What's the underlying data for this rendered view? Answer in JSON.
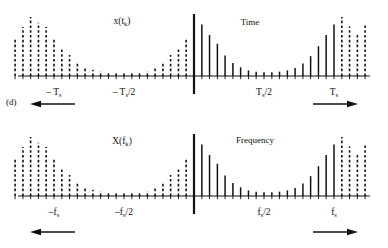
{
  "figure": {
    "panel_label": "(d)"
  },
  "panels": [
    {
      "id": "time",
      "signal_label": "x(t",
      "signal_label_sub": "k",
      "signal_label_close": ")",
      "domain_label": "Time",
      "ticks": [
        {
          "label": "– T",
          "sub": "s",
          "suffix": "",
          "x": -1.0
        },
        {
          "label": "– T",
          "sub": "s",
          "suffix": "/2",
          "x": -0.5
        },
        {
          "label": "T",
          "sub": "s",
          "suffix": "/2",
          "x": 0.5
        },
        {
          "label": "T",
          "sub": "s",
          "suffix": "",
          "x": 1.0
        }
      ],
      "left_arrow": "periodic-extension-left",
      "right_arrow": "periodic-extension-right"
    },
    {
      "id": "frequency",
      "signal_label": "X(f",
      "signal_label_sub": "k",
      "signal_label_close": ")",
      "domain_label": "Frequency",
      "ticks": [
        {
          "label": "–f",
          "sub": "s",
          "suffix": "",
          "x": -1.0
        },
        {
          "label": "–f",
          "sub": "s",
          "suffix": "/2",
          "x": -0.5
        },
        {
          "label": "f",
          "sub": "s",
          "suffix": "/2",
          "x": 0.5
        },
        {
          "label": "f",
          "sub": "s",
          "suffix": "",
          "x": 1.0
        }
      ],
      "left_arrow": "periodic-extension-left",
      "right_arrow": "periodic-extension-right"
    }
  ],
  "chart_data": {
    "type": "bar",
    "title": "",
    "subtitle": "",
    "xlabel": "",
    "ylabel": "",
    "grid": false,
    "legend": null,
    "note": "Two stem (impulse-train) plots. Stems are sampled values of a decaying exponential-like envelope peaking at the origin and repeating with period Ts (time panel) / fs (frequency panel). Solid stems mark the principal period; dashed stems mark the periodic repetitions.",
    "panels": [
      {
        "id": "time",
        "xlabel": "Time",
        "ylabel": "x(t_k)",
        "xlim": [
          -1.32,
          1.32
        ],
        "ylim": [
          0,
          1.0
        ],
        "xticks": [
          -1.0,
          -0.5,
          0.5,
          1.0
        ],
        "xticklabels": [
          "-T_s",
          "-T_s/2",
          "T_s/2",
          "T_s"
        ],
        "sample_spacing": 0.0555,
        "stems": [
          {
            "x": -1.278,
            "y": 0.62,
            "style": "dashed"
          },
          {
            "x": -1.222,
            "y": 0.79,
            "style": "dashed"
          },
          {
            "x": -1.167,
            "y": 0.95,
            "style": "dashed"
          },
          {
            "x": -1.111,
            "y": 0.86,
            "style": "dashed"
          },
          {
            "x": -1.056,
            "y": 0.79,
            "style": "dashed"
          },
          {
            "x": -1.0,
            "y": 0.62,
            "style": "dashed"
          },
          {
            "x": -0.944,
            "y": 0.46,
            "style": "dashed"
          },
          {
            "x": -0.889,
            "y": 0.34,
            "style": "dashed"
          },
          {
            "x": -0.833,
            "y": 0.23,
            "style": "dashed"
          },
          {
            "x": -0.778,
            "y": 0.14,
            "style": "dashed"
          },
          {
            "x": -0.722,
            "y": 0.1,
            "style": "dashed"
          },
          {
            "x": -0.667,
            "y": 0.08,
            "style": "dashed"
          },
          {
            "x": -0.611,
            "y": 0.07,
            "style": "dashed"
          },
          {
            "x": -0.556,
            "y": 0.06,
            "style": "dashed"
          },
          {
            "x": -0.5,
            "y": 0.06,
            "style": "dashed"
          },
          {
            "x": -0.444,
            "y": 0.06,
            "style": "dashed"
          },
          {
            "x": -0.389,
            "y": 0.07,
            "style": "dashed"
          },
          {
            "x": -0.333,
            "y": 0.08,
            "style": "dashed"
          },
          {
            "x": -0.278,
            "y": 0.14,
            "style": "dashed"
          },
          {
            "x": -0.222,
            "y": 0.23,
            "style": "dashed"
          },
          {
            "x": -0.167,
            "y": 0.34,
            "style": "dashed"
          },
          {
            "x": -0.111,
            "y": 0.46,
            "style": "dashed"
          },
          {
            "x": -0.056,
            "y": 0.62,
            "style": "dashed"
          },
          {
            "x": 0.0,
            "y": 1.0,
            "style": "center"
          },
          {
            "x": 0.056,
            "y": 0.83,
            "style": "solid"
          },
          {
            "x": 0.111,
            "y": 0.66,
            "style": "solid"
          },
          {
            "x": 0.167,
            "y": 0.52,
            "style": "solid"
          },
          {
            "x": 0.222,
            "y": 0.33,
            "style": "solid"
          },
          {
            "x": 0.278,
            "y": 0.21,
            "style": "solid"
          },
          {
            "x": 0.333,
            "y": 0.14,
            "style": "solid"
          },
          {
            "x": 0.389,
            "y": 0.09,
            "style": "solid"
          },
          {
            "x": 0.444,
            "y": 0.07,
            "style": "solid"
          },
          {
            "x": 0.5,
            "y": 0.06,
            "style": "solid"
          },
          {
            "x": 0.556,
            "y": 0.06,
            "style": "solid"
          },
          {
            "x": 0.611,
            "y": 0.07,
            "style": "solid"
          },
          {
            "x": 0.667,
            "y": 0.09,
            "style": "solid"
          },
          {
            "x": 0.722,
            "y": 0.13,
            "style": "solid"
          },
          {
            "x": 0.778,
            "y": 0.2,
            "style": "solid"
          },
          {
            "x": 0.833,
            "y": 0.32,
            "style": "solid"
          },
          {
            "x": 0.889,
            "y": 0.48,
            "style": "solid"
          },
          {
            "x": 0.944,
            "y": 0.66,
            "style": "solid"
          },
          {
            "x": 1.0,
            "y": 0.83,
            "style": "solid"
          },
          {
            "x": 1.056,
            "y": 0.95,
            "style": "dashed"
          },
          {
            "x": 1.111,
            "y": 0.8,
            "style": "dashed"
          },
          {
            "x": 1.167,
            "y": 0.66,
            "style": "dashed"
          },
          {
            "x": 1.222,
            "y": 0.82,
            "style": "dashed"
          }
        ]
      },
      {
        "id": "frequency",
        "xlabel": "Frequency",
        "ylabel": "X(f_k)",
        "xlim": [
          -1.32,
          1.32
        ],
        "ylim": [
          0,
          1.0
        ],
        "xticks": [
          -1.0,
          -0.5,
          0.5,
          1.0
        ],
        "xticklabels": [
          "-f_s",
          "-f_s/2",
          "f_s/2",
          "f_s"
        ],
        "sample_spacing": 0.0555,
        "stems": [
          {
            "x": -1.278,
            "y": 0.62,
            "style": "dashed"
          },
          {
            "x": -1.222,
            "y": 0.79,
            "style": "dashed"
          },
          {
            "x": -1.167,
            "y": 0.95,
            "style": "dashed"
          },
          {
            "x": -1.111,
            "y": 0.86,
            "style": "dashed"
          },
          {
            "x": -1.056,
            "y": 0.79,
            "style": "dashed"
          },
          {
            "x": -1.0,
            "y": 0.62,
            "style": "dashed"
          },
          {
            "x": -0.944,
            "y": 0.46,
            "style": "dashed"
          },
          {
            "x": -0.889,
            "y": 0.34,
            "style": "dashed"
          },
          {
            "x": -0.833,
            "y": 0.23,
            "style": "dashed"
          },
          {
            "x": -0.778,
            "y": 0.14,
            "style": "dashed"
          },
          {
            "x": -0.722,
            "y": 0.1,
            "style": "dashed"
          },
          {
            "x": -0.667,
            "y": 0.08,
            "style": "dashed"
          },
          {
            "x": -0.611,
            "y": 0.07,
            "style": "dashed"
          },
          {
            "x": -0.556,
            "y": 0.06,
            "style": "dashed"
          },
          {
            "x": -0.5,
            "y": 0.06,
            "style": "dashed"
          },
          {
            "x": -0.444,
            "y": 0.06,
            "style": "dashed"
          },
          {
            "x": -0.389,
            "y": 0.07,
            "style": "dashed"
          },
          {
            "x": -0.333,
            "y": 0.08,
            "style": "dashed"
          },
          {
            "x": -0.278,
            "y": 0.14,
            "style": "dashed"
          },
          {
            "x": -0.222,
            "y": 0.23,
            "style": "dashed"
          },
          {
            "x": -0.167,
            "y": 0.34,
            "style": "dashed"
          },
          {
            "x": -0.111,
            "y": 0.46,
            "style": "dashed"
          },
          {
            "x": -0.056,
            "y": 0.62,
            "style": "dashed"
          },
          {
            "x": 0.0,
            "y": 1.0,
            "style": "center"
          },
          {
            "x": 0.056,
            "y": 0.83,
            "style": "solid"
          },
          {
            "x": 0.111,
            "y": 0.66,
            "style": "solid"
          },
          {
            "x": 0.167,
            "y": 0.52,
            "style": "solid"
          },
          {
            "x": 0.222,
            "y": 0.33,
            "style": "solid"
          },
          {
            "x": 0.278,
            "y": 0.21,
            "style": "solid"
          },
          {
            "x": 0.333,
            "y": 0.14,
            "style": "solid"
          },
          {
            "x": 0.389,
            "y": 0.09,
            "style": "solid"
          },
          {
            "x": 0.444,
            "y": 0.07,
            "style": "solid"
          },
          {
            "x": 0.5,
            "y": 0.06,
            "style": "solid"
          },
          {
            "x": 0.556,
            "y": 0.06,
            "style": "solid"
          },
          {
            "x": 0.611,
            "y": 0.07,
            "style": "solid"
          },
          {
            "x": 0.667,
            "y": 0.09,
            "style": "solid"
          },
          {
            "x": 0.722,
            "y": 0.13,
            "style": "solid"
          },
          {
            "x": 0.778,
            "y": 0.2,
            "style": "solid"
          },
          {
            "x": 0.833,
            "y": 0.32,
            "style": "solid"
          },
          {
            "x": 0.889,
            "y": 0.48,
            "style": "solid"
          },
          {
            "x": 0.944,
            "y": 0.66,
            "style": "solid"
          },
          {
            "x": 1.0,
            "y": 0.83,
            "style": "solid"
          },
          {
            "x": 1.056,
            "y": 0.95,
            "style": "dashed"
          },
          {
            "x": 1.111,
            "y": 0.8,
            "style": "dashed"
          },
          {
            "x": 1.167,
            "y": 0.66,
            "style": "dashed"
          },
          {
            "x": 1.222,
            "y": 0.82,
            "style": "dashed"
          }
        ]
      }
    ]
  }
}
